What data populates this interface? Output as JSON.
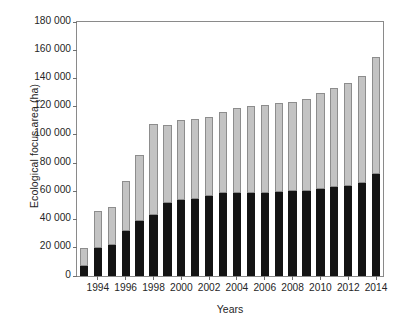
{
  "chart_data": {
    "type": "bar",
    "stacked": true,
    "title": "",
    "xlabel": "Years",
    "ylabel": "Ecological focus area (ha)",
    "ylim": [
      0,
      180000
    ],
    "ytick_labels": [
      "0",
      "20 000",
      "40 000",
      "60 000",
      "80 000",
      "100 000",
      "120 000",
      "140 000",
      "160 000",
      "180 000"
    ],
    "ytick_values": [
      0,
      20000,
      40000,
      60000,
      80000,
      100000,
      120000,
      140000,
      160000,
      180000
    ],
    "xtick_labels": [
      "1994",
      "1996",
      "1998",
      "2000",
      "2002",
      "2004",
      "2006",
      "2008",
      "2010",
      "2012",
      "2014"
    ],
    "xtick_values": [
      1994,
      1996,
      1998,
      2000,
      2002,
      2004,
      2006,
      2008,
      2010,
      2012,
      2014
    ],
    "grid": false,
    "legend": "none",
    "categories": [
      1993,
      1994,
      1995,
      1996,
      1997,
      1998,
      1999,
      2000,
      2001,
      2002,
      2003,
      2004,
      2005,
      2006,
      2007,
      2008,
      2009,
      2010,
      2011,
      2012,
      2013,
      2014
    ],
    "series": [
      {
        "name": "lower-segment",
        "color": "#141414",
        "values": [
          7000,
          20000,
          22000,
          32000,
          39000,
          43500,
          52000,
          54000,
          54500,
          56500,
          58500,
          58500,
          59000,
          59000,
          59500,
          60000,
          60000,
          61500,
          63000,
          64000,
          66000,
          72500
        ]
      },
      {
        "name": "upper-segment",
        "color": "#c3c3c3",
        "values": [
          13000,
          26000,
          27000,
          35000,
          47000,
          64500,
          55000,
          56500,
          56500,
          56000,
          57500,
          60500,
          61500,
          62000,
          63000,
          63500,
          65500,
          68500,
          70000,
          73000,
          76000,
          82500
        ]
      }
    ],
    "totals": [
      20000,
      46000,
      49000,
      67000,
      86000,
      108000,
      107000,
      110500,
      111000,
      112500,
      116000,
      119000,
      120500,
      121000,
      122500,
      123500,
      125500,
      130000,
      133000,
      137000,
      142000,
      155000
    ]
  }
}
